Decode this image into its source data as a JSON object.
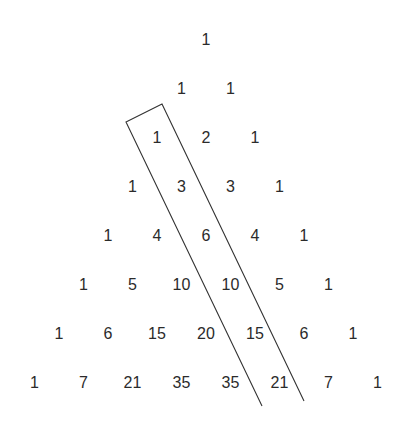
{
  "diagram": {
    "rows": [
      [
        1
      ],
      [
        1,
        1
      ],
      [
        1,
        2,
        1
      ],
      [
        1,
        3,
        3,
        1
      ],
      [
        1,
        4,
        6,
        4,
        1
      ],
      [
        1,
        5,
        10,
        10,
        5,
        1
      ],
      [
        1,
        6,
        15,
        20,
        15,
        6,
        1
      ],
      [
        1,
        7,
        21,
        35,
        35,
        21,
        7,
        1
      ]
    ],
    "highlight": {
      "description": "Open-ended band enclosing the diagonal 1, 3, 6, 10, 15, 21",
      "values": [
        1,
        3,
        6,
        10,
        15,
        21
      ],
      "stroke_color": "#333333"
    },
    "text_color": "#2b2b2b"
  }
}
